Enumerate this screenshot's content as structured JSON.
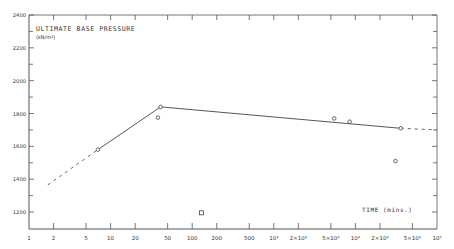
{
  "chart_data": {
    "type": "line",
    "title": "ULTIMATE BASE PRESSURE",
    "ylabel": "ULTIMATE BASE PRESSURE (kN/m²)",
    "ylabel_units": "(kN/m²)",
    "xlabel": "TIME (mins.)",
    "xscale": "log",
    "xlim": [
      1,
      100000
    ],
    "ylim": [
      1100,
      2400
    ],
    "grid": false,
    "legend": null,
    "x_ticks": [
      {
        "value": 1,
        "label": "1"
      },
      {
        "value": 2,
        "label": "2"
      },
      {
        "value": 5,
        "label": "5"
      },
      {
        "value": 10,
        "label": "10"
      },
      {
        "value": 20,
        "label": "20"
      },
      {
        "value": 50,
        "label": "50"
      },
      {
        "value": 100,
        "label": "100"
      },
      {
        "value": 200,
        "label": "200"
      },
      {
        "value": 500,
        "label": "500"
      },
      {
        "value": 1000,
        "label": "10³"
      },
      {
        "value": 2000,
        "label": "2×10³"
      },
      {
        "value": 5000,
        "label": "5×10³"
      },
      {
        "value": 10000,
        "label": "10⁴"
      },
      {
        "value": 20000,
        "label": "2×10⁴"
      },
      {
        "value": 50000,
        "label": "5×10⁴"
      },
      {
        "value": 100000,
        "label": "10⁵"
      }
    ],
    "y_ticks": [
      {
        "value": 1200,
        "label": "1200"
      },
      {
        "value": 1400,
        "label": "1400"
      },
      {
        "value": 1600,
        "label": "1600"
      },
      {
        "value": 1800,
        "label": "1800"
      },
      {
        "value": 2000,
        "label": "2000"
      },
      {
        "value": 2200,
        "label": "2200"
      },
      {
        "value": 2400,
        "label": "2400"
      }
    ],
    "series": [
      {
        "name": "observed points (circles)",
        "marker": "circle",
        "points": [
          {
            "x": 7,
            "y": 1580
          },
          {
            "x": 38,
            "y": 1775
          },
          {
            "x": 41,
            "y": 1840
          },
          {
            "x": 5500,
            "y": 1770
          },
          {
            "x": 8500,
            "y": 1750
          },
          {
            "x": 31000,
            "y": 1510
          },
          {
            "x": 36000,
            "y": 1710
          }
        ]
      },
      {
        "name": "outlier (square)",
        "marker": "square",
        "points": [
          {
            "x": 130,
            "y": 1195
          }
        ]
      },
      {
        "name": "trend line",
        "style": "solid",
        "points": [
          {
            "x": 7,
            "y": 1580
          },
          {
            "x": 41,
            "y": 1840
          },
          {
            "x": 36000,
            "y": 1710
          }
        ]
      },
      {
        "name": "extrapolation (dashed)",
        "style": "dashed",
        "segments": [
          [
            {
              "x": 1.7,
              "y": 1365
            },
            {
              "x": 7,
              "y": 1580
            }
          ],
          [
            {
              "x": 36000,
              "y": 1710
            },
            {
              "x": 100000,
              "y": 1700
            }
          ]
        ]
      }
    ]
  }
}
